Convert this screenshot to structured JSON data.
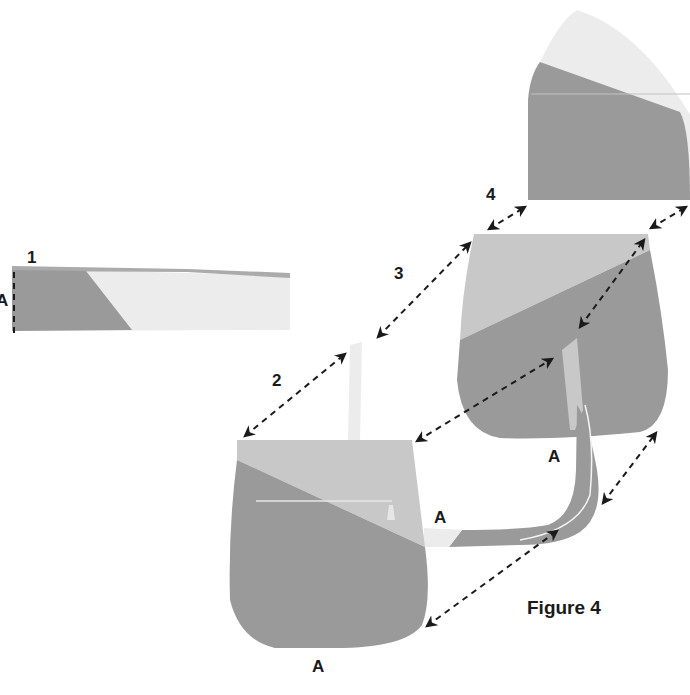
{
  "figure": {
    "caption": "Figure 4",
    "steps": [
      "1",
      "2",
      "3",
      "4"
    ],
    "point_label": "A"
  },
  "colors": {
    "dark": "#9a9a9a",
    "mid": "#ababab",
    "light": "#c8c8c8",
    "pale": "#ececec",
    "arrow": "#1a1a1a",
    "background": "#ffffff"
  },
  "pieces": [
    {
      "name": "strip",
      "step": "1",
      "label": "A"
    },
    {
      "name": "front-panel",
      "step": "2",
      "label": "A"
    },
    {
      "name": "back-panel",
      "step": "3",
      "label": "A"
    },
    {
      "name": "flap",
      "step": "4"
    },
    {
      "name": "gusset-strap",
      "label": "A"
    }
  ]
}
